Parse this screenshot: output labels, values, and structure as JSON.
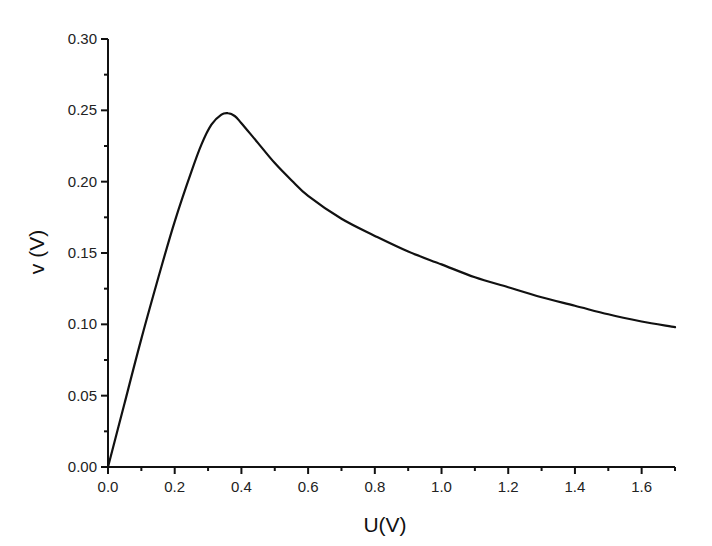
{
  "chart_data": {
    "type": "line",
    "title": "",
    "xlabel": "U(V)",
    "ylabel": "v (V)",
    "xlim": [
      0.0,
      1.7
    ],
    "ylim": [
      0.0,
      0.3
    ],
    "grid": false,
    "legend": null,
    "x_ticks": [
      "0.0",
      "0.2",
      "0.4",
      "0.6",
      "0.8",
      "1.0",
      "1.2",
      "1.4",
      "1.6"
    ],
    "y_ticks": [
      "0.00",
      "0.05",
      "0.10",
      "0.15",
      "0.20",
      "0.25",
      "0.30"
    ],
    "series": [
      {
        "name": "v(U)",
        "color": "#111111",
        "x": [
          0.0,
          0.05,
          0.1,
          0.15,
          0.2,
          0.25,
          0.28,
          0.31,
          0.34,
          0.36,
          0.38,
          0.4,
          0.45,
          0.5,
          0.55,
          0.6,
          0.7,
          0.8,
          0.9,
          1.0,
          1.1,
          1.2,
          1.3,
          1.4,
          1.5,
          1.6,
          1.7
        ],
        "y": [
          0.0,
          0.045,
          0.09,
          0.132,
          0.172,
          0.207,
          0.226,
          0.24,
          0.247,
          0.248,
          0.246,
          0.241,
          0.227,
          0.213,
          0.201,
          0.19,
          0.174,
          0.162,
          0.151,
          0.142,
          0.133,
          0.126,
          0.119,
          0.113,
          0.107,
          0.102,
          0.098
        ]
      }
    ]
  }
}
